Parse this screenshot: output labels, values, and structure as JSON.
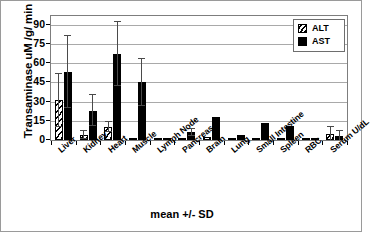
{
  "chart_data": {
    "type": "bar",
    "title": "",
    "xlabel": "mean +/- SD",
    "ylabel": "Transaminase uM /g/ min",
    "ylim": [
      0,
      97
    ],
    "yticks": [
      0,
      15,
      30,
      45,
      60,
      75,
      90
    ],
    "ytick_labels": [
      "0",
      "15",
      "30",
      "45",
      "60",
      "75",
      "90"
    ],
    "grid": true,
    "legend_position": "top-right",
    "categories": [
      "Liver",
      "Kidney",
      "Heart",
      "Muscle",
      "Lymph Node",
      "Pancreas",
      "Brain",
      "Lung",
      "Small Intestine",
      "Spleen",
      "RBC",
      "Serum U/dL"
    ],
    "series": [
      {
        "name": "ALT",
        "pattern": "diagonal-hatch",
        "color": "#ffffff",
        "values": [
          31,
          4,
          10,
          1.5,
          0.6,
          1.2,
          2,
          0.6,
          0.6,
          0.4,
          0.3,
          4.5
        ],
        "errors": [
          21,
          3,
          4,
          0,
          0,
          0,
          0,
          0,
          0,
          0,
          0,
          5.5
        ]
      },
      {
        "name": "AST",
        "pattern": "solid",
        "color": "#000000",
        "values": [
          53,
          23,
          67,
          45,
          1.2,
          6,
          18,
          4,
          13,
          11,
          0.6,
          3
        ],
        "errors": [
          28,
          12,
          25,
          18,
          0,
          3,
          0,
          0,
          0,
          0,
          0,
          4
        ]
      }
    ]
  },
  "legend": {
    "items": [
      {
        "label": "ALT",
        "swatch": "hatched-square-icon"
      },
      {
        "label": "AST",
        "swatch": "black-square-icon"
      }
    ]
  }
}
